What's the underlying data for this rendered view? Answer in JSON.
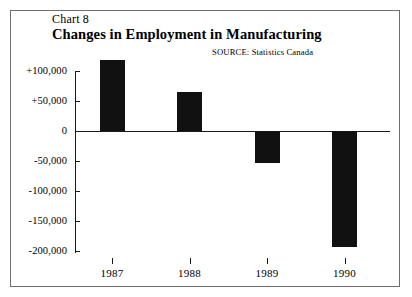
{
  "figure": {
    "chart_number": "Chart 8",
    "title": "Changes in Employment in Manufacturing",
    "source": "SOURCE:  Statistics Canada",
    "frame_color": "#6e6e6e",
    "bar_color": "#111111",
    "axis_color": "#1a1a1a",
    "background": "#ffffff"
  },
  "chart_data": {
    "type": "bar",
    "title": "Changes in Employment in Manufacturing",
    "subtitle": "Chart 8",
    "annotations": [
      "SOURCE:  Statistics Canada"
    ],
    "xlabel": "",
    "ylabel": "",
    "categories": [
      "1987",
      "1988",
      "1989",
      "1990"
    ],
    "values": [
      118000,
      65000,
      -53000,
      -193000
    ],
    "ylim": [
      -200000,
      100000
    ],
    "ytick_values": [
      100000,
      50000,
      0,
      -50000,
      -100000,
      -150000,
      -200000
    ],
    "ytick_labels": [
      "+100,000",
      "+50,000",
      "0",
      "-50,000",
      "-100,000",
      "-150,000",
      "-200,000"
    ],
    "grid": false,
    "legend": null,
    "legend_position": "none"
  }
}
